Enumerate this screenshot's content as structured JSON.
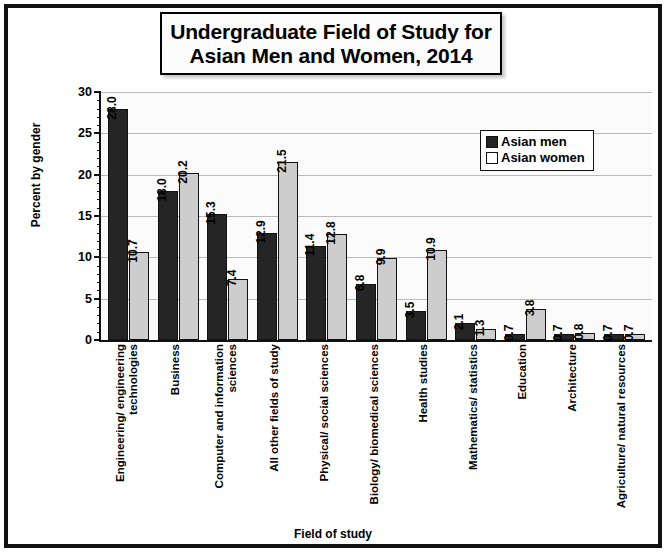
{
  "chart_data": {
    "type": "bar",
    "title": "Undergraduate Field of Study for Asian Men and Women, 2014",
    "title_lines": [
      "Undergraduate Field of Study for",
      "Asian Men and Women, 2014"
    ],
    "xlabel": "Field of study",
    "ylabel": "Percent by gender",
    "ylim": [
      0,
      30
    ],
    "yticks": [
      0,
      5,
      10,
      15,
      20,
      25,
      30
    ],
    "ytick_labels": [
      "0",
      "5",
      "10",
      "15",
      "20",
      "25",
      "30"
    ],
    "grid": true,
    "legend_position": "top-right",
    "categories": [
      "Engineering/ engineering technologies",
      "Business",
      "Computer and information sciences",
      "All other fields of study",
      "Physical/ social sciences",
      "Biology/ biomedical sciences",
      "Health studies",
      "Mathematics/ statistics",
      "Education",
      "Architecture",
      "Agriculture/ natural resources"
    ],
    "series": [
      {
        "name": "Asian men",
        "color": "#252525",
        "values": [
          28.0,
          18.0,
          15.3,
          12.9,
          11.4,
          6.8,
          3.5,
          2.1,
          0.7,
          0.7,
          0.7
        ],
        "labels": [
          "28.0",
          "18.0",
          "15.3",
          "12.9",
          "11.4",
          "6.8",
          "3.5",
          "2.1",
          "0.7",
          "0.7",
          "0.7"
        ]
      },
      {
        "name": "Asian women",
        "color": "#cdcdcd",
        "values": [
          10.7,
          20.2,
          7.4,
          21.5,
          12.8,
          9.9,
          10.9,
          1.3,
          3.8,
          0.8,
          0.7
        ],
        "labels": [
          "10.7",
          "20.2",
          "7.4",
          "21.5",
          "12.8",
          "9.9",
          "10.9",
          "1.3",
          "3.8",
          "0.8",
          "0.7"
        ]
      }
    ]
  }
}
